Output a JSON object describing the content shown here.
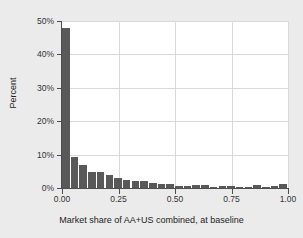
{
  "chart_data": {
    "type": "bar",
    "title": "",
    "xlabel": "Market share of AA+US combined, at baseline",
    "ylabel": "Percent",
    "xlim": [
      0.0,
      1.0
    ],
    "ylim": [
      0,
      50
    ],
    "grid": true,
    "legend": null,
    "bar_color": "#595959",
    "plot_background": "#ffffff",
    "figure_background": "#ebebeb",
    "gridline_color": "#d9d9d9",
    "axis_color": "#4d4d4d",
    "bin_width": 0.0385,
    "xticks": [
      0.0,
      0.25,
      0.5,
      0.75,
      1.0
    ],
    "xtick_labels": [
      "0.00",
      "0.25",
      "0.50",
      "0.75",
      "1.00"
    ],
    "yticks": [
      0,
      10,
      20,
      30,
      40,
      50
    ],
    "ytick_labels": [
      "0%",
      "10%",
      "20%",
      "30%",
      "40%",
      "50%"
    ],
    "x": [
      0.019,
      0.058,
      0.096,
      0.135,
      0.173,
      0.212,
      0.25,
      0.288,
      0.327,
      0.365,
      0.404,
      0.442,
      0.481,
      0.519,
      0.558,
      0.596,
      0.635,
      0.673,
      0.712,
      0.75,
      0.788,
      0.827,
      0.865,
      0.904,
      0.942,
      0.981
    ],
    "categories": [
      "0.00-0.04",
      "0.04-0.08",
      "0.08-0.12",
      "0.12-0.15",
      "0.15-0.19",
      "0.19-0.23",
      "0.23-0.27",
      "0.27-0.31",
      "0.31-0.35",
      "0.35-0.38",
      "0.38-0.42",
      "0.42-0.46",
      "0.46-0.50",
      "0.50-0.54",
      "0.54-0.58",
      "0.58-0.62",
      "0.62-0.65",
      "0.65-0.69",
      "0.69-0.73",
      "0.73-0.77",
      "0.77-0.81",
      "0.81-0.85",
      "0.85-0.88",
      "0.88-0.92",
      "0.92-0.96",
      "0.96-1.00"
    ],
    "values": [
      48.0,
      9.4,
      7.0,
      4.7,
      4.7,
      3.8,
      3.1,
      2.3,
      2.0,
      2.1,
      1.4,
      1.3,
      1.3,
      0.7,
      0.7,
      0.9,
      0.9,
      0.3,
      0.6,
      0.6,
      0.4,
      0.4,
      0.9,
      0.3,
      0.5,
      1.2
    ]
  }
}
